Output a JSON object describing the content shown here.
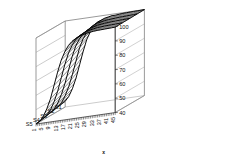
{
  "chart_data": {
    "type": "line",
    "title": "",
    "subtitle": "",
    "xlabel": "x",
    "ylabel": "",
    "zlabel": "",
    "projection": "3d-surface-wireframe",
    "grid": true,
    "legend_position": "none",
    "xlim": [
      1,
      45
    ],
    "zlim": [
      40,
      100
    ],
    "x_ticks": [
      1,
      5,
      9,
      13,
      17,
      21,
      25,
      29,
      33,
      37,
      41,
      45
    ],
    "z_ticks": [
      40,
      50,
      60,
      70,
      80,
      90,
      100
    ],
    "series_axis_labels": [
      "S1",
      "S2",
      "S3",
      "S4",
      "S5"
    ],
    "x": [
      1,
      3,
      5,
      7,
      9,
      11,
      13,
      15,
      17,
      19,
      21,
      23,
      25,
      27,
      29,
      31,
      33,
      35,
      37,
      39,
      41,
      43,
      45
    ],
    "series": [
      {
        "name": "S1",
        "values": [
          44,
          47,
          52,
          59,
          68,
          77,
          85,
          90,
          94,
          96,
          97,
          98,
          98.5,
          99,
          99,
          99.3,
          99.5,
          99.6,
          99.7,
          99.8,
          99.8,
          99.9,
          100
        ]
      },
      {
        "name": "S2",
        "values": [
          43,
          45.5,
          50,
          56,
          64,
          73,
          82,
          88,
          92,
          95,
          96.5,
          97.5,
          98,
          98.5,
          98.8,
          99,
          99.2,
          99.4,
          99.5,
          99.6,
          99.7,
          99.8,
          99.9
        ]
      },
      {
        "name": "S3",
        "values": [
          42,
          44,
          48,
          53.5,
          61,
          70,
          79,
          86,
          90.5,
          93.5,
          95.5,
          96.8,
          97.6,
          98.2,
          98.6,
          98.9,
          99.1,
          99.3,
          99.4,
          99.5,
          99.6,
          99.7,
          99.8
        ]
      },
      {
        "name": "S4",
        "values": [
          41,
          42.8,
          46.2,
          51.5,
          58.5,
          67.5,
          76.5,
          84,
          89,
          92.5,
          94.8,
          96.2,
          97.2,
          97.9,
          98.4,
          98.8,
          99,
          99.2,
          99.3,
          99.4,
          99.5,
          99.6,
          99.7
        ]
      },
      {
        "name": "S5",
        "values": [
          40,
          41.5,
          44.5,
          49.5,
          56,
          65,
          74,
          82,
          87.5,
          91.5,
          94,
          95.6,
          96.8,
          97.6,
          98.2,
          98.6,
          98.9,
          99.1,
          99.2,
          99.3,
          99.4,
          99.5,
          99.6
        ]
      }
    ],
    "colors": {
      "line": "#000000",
      "grid": "#999999",
      "axis": "#555555",
      "background": "#ffffff"
    }
  },
  "axes": {
    "x_axis_title": "x",
    "x_tick_labels": [
      "1",
      "5",
      "9",
      "13",
      "17",
      "21",
      "25",
      "29",
      "33",
      "37",
      "41",
      "45"
    ],
    "z_tick_labels": [
      "100",
      "90",
      "80",
      "70",
      "60",
      "50",
      "40"
    ],
    "series_labels": [
      "S1",
      "S2",
      "S3",
      "S4",
      "S5"
    ]
  }
}
